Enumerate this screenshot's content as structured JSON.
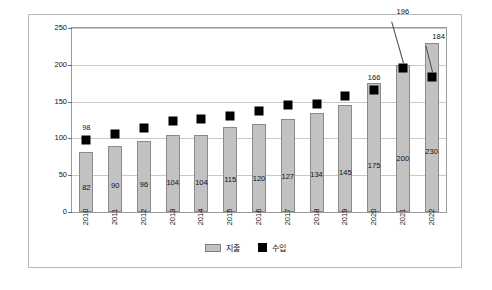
{
  "chart_data": {
    "type": "bar",
    "title": "",
    "xlabel": "",
    "ylabel": "",
    "ylim": [
      0,
      250
    ],
    "yticks": [
      0,
      50,
      100,
      150,
      200,
      250
    ],
    "grid": true,
    "legend_position": "bottom",
    "categories": [
      "2010",
      "2011",
      "2012",
      "2013",
      "2014",
      "2015",
      "2016",
      "2017",
      "2018",
      "2019",
      "2020",
      "2021",
      "2022"
    ],
    "series": [
      {
        "name": "지출",
        "type": "bar",
        "values": [
          82,
          90,
          96,
          104,
          104,
          115,
          120,
          127,
          134,
          145,
          175,
          200,
          230
        ],
        "labels": [
          "82",
          "90",
          "96",
          "104",
          "104",
          "115",
          "120",
          "127",
          "134",
          "145",
          "175",
          "200",
          "230"
        ],
        "color": "#c2c2c2"
      },
      {
        "name": "수입",
        "type": "scatter",
        "values": [
          98,
          106,
          114,
          124,
          127,
          131,
          137,
          145,
          147,
          157,
          166,
          196,
          184
        ],
        "labels": [
          "98",
          "",
          "",
          "",
          "",
          "",
          "",
          "",
          "",
          "",
          "166",
          "196",
          "184"
        ],
        "color": "#000000"
      }
    ]
  },
  "legend": {
    "items": [
      {
        "label": "지출",
        "swatch": "bar-swatch"
      },
      {
        "label": "수입",
        "swatch": "square-swatch"
      }
    ]
  }
}
